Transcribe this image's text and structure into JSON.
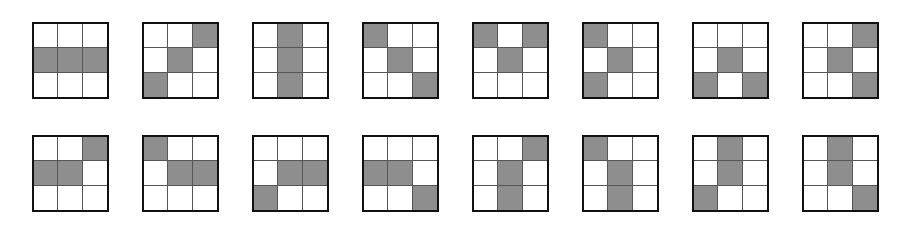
{
  "figure": {
    "colors": {
      "filled": "#8e8e8e",
      "empty": "#ffffff",
      "border": "#111111"
    },
    "rows": [
      {
        "grids": [
          [
            [
              0,
              0,
              0
            ],
            [
              1,
              1,
              1
            ],
            [
              0,
              0,
              0
            ]
          ],
          [
            [
              0,
              0,
              1
            ],
            [
              0,
              1,
              0
            ],
            [
              1,
              0,
              0
            ]
          ],
          [
            [
              0,
              1,
              0
            ],
            [
              0,
              1,
              0
            ],
            [
              0,
              1,
              0
            ]
          ],
          [
            [
              1,
              0,
              0
            ],
            [
              0,
              1,
              0
            ],
            [
              0,
              0,
              1
            ]
          ],
          [
            [
              1,
              0,
              1
            ],
            [
              0,
              1,
              0
            ],
            [
              0,
              0,
              0
            ]
          ],
          [
            [
              1,
              0,
              0
            ],
            [
              0,
              1,
              0
            ],
            [
              1,
              0,
              0
            ]
          ],
          [
            [
              0,
              0,
              0
            ],
            [
              0,
              1,
              0
            ],
            [
              1,
              0,
              1
            ]
          ],
          [
            [
              0,
              0,
              1
            ],
            [
              0,
              1,
              0
            ],
            [
              0,
              0,
              1
            ]
          ]
        ]
      },
      {
        "grids": [
          [
            [
              0,
              0,
              1
            ],
            [
              1,
              1,
              0
            ],
            [
              0,
              0,
              0
            ]
          ],
          [
            [
              1,
              0,
              0
            ],
            [
              0,
              1,
              1
            ],
            [
              0,
              0,
              0
            ]
          ],
          [
            [
              0,
              0,
              0
            ],
            [
              0,
              1,
              1
            ],
            [
              1,
              0,
              0
            ]
          ],
          [
            [
              0,
              0,
              0
            ],
            [
              1,
              1,
              0
            ],
            [
              0,
              0,
              1
            ]
          ],
          [
            [
              0,
              0,
              1
            ],
            [
              0,
              1,
              0
            ],
            [
              0,
              1,
              0
            ]
          ],
          [
            [
              1,
              0,
              0
            ],
            [
              0,
              1,
              0
            ],
            [
              0,
              1,
              0
            ]
          ],
          [
            [
              0,
              1,
              0
            ],
            [
              0,
              1,
              0
            ],
            [
              1,
              0,
              0
            ]
          ],
          [
            [
              0,
              1,
              0
            ],
            [
              0,
              1,
              0
            ],
            [
              0,
              0,
              1
            ]
          ]
        ]
      }
    ]
  }
}
